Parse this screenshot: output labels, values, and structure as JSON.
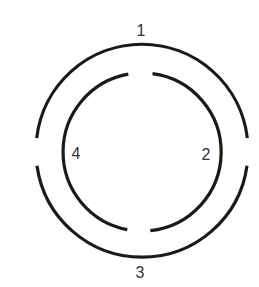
{
  "diagram": {
    "type": "concentric-broken-rings",
    "stroke_color": "#1a1a1a",
    "label_color": "#333333",
    "background": "#ffffff",
    "labels": {
      "top": "1",
      "right": "2",
      "bottom": "3",
      "left": "4"
    },
    "outer_ring": {
      "gaps": [
        "left",
        "right"
      ],
      "segments": [
        "top-arc",
        "bottom-arc"
      ]
    },
    "inner_ring": {
      "gaps": [
        "top",
        "bottom"
      ],
      "segments": [
        "left-arc",
        "right-arc"
      ]
    }
  }
}
